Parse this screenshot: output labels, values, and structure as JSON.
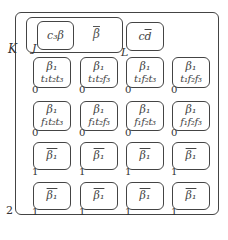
{
  "outer": {
    "label": "K",
    "corner_label": "2"
  },
  "group_j": {
    "label": "J",
    "inner_label": "c₃β",
    "text": "β"
  },
  "group_l": {
    "label": "L",
    "text": "cd"
  },
  "rows": [
    {
      "index_label": "0",
      "cells": [
        {
          "line1": "β₁",
          "line2": "t₁t₂t₃",
          "bar": false
        },
        {
          "line1": "β₁",
          "line2": "t₁t₂f₃",
          "bar": false
        },
        {
          "line1": "β₁",
          "line2": "t₁f₂t₃",
          "bar": false
        },
        {
          "line1": "β₁",
          "line2": "t₁f₂f₃",
          "bar": false
        }
      ]
    },
    {
      "index_label": "0",
      "cells": [
        {
          "line1": "β₁",
          "line2": "f₁t₂t₃",
          "bar": false
        },
        {
          "line1": "β₁",
          "line2": "f₁t₂f₃",
          "bar": false
        },
        {
          "line1": "β₁",
          "line2": "f₁f₂t₃",
          "bar": false
        },
        {
          "line1": "β₁",
          "line2": "f₁f₂f₃",
          "bar": false
        }
      ]
    },
    {
      "index_label": "1",
      "cells": [
        {
          "line1": "β₁",
          "line2": "",
          "bar": true
        },
        {
          "line1": "β₁",
          "line2": "",
          "bar": true
        },
        {
          "line1": "β₁",
          "line2": "",
          "bar": true
        },
        {
          "line1": "β₁",
          "line2": "",
          "bar": true
        }
      ]
    },
    {
      "index_label": "1",
      "cells": [
        {
          "line1": "β₁",
          "line2": "",
          "bar": true
        },
        {
          "line1": "β₁",
          "line2": "",
          "bar": true
        },
        {
          "line1": "β₁",
          "line2": "",
          "bar": true
        },
        {
          "line1": "β₁",
          "line2": "",
          "bar": true
        }
      ]
    }
  ]
}
